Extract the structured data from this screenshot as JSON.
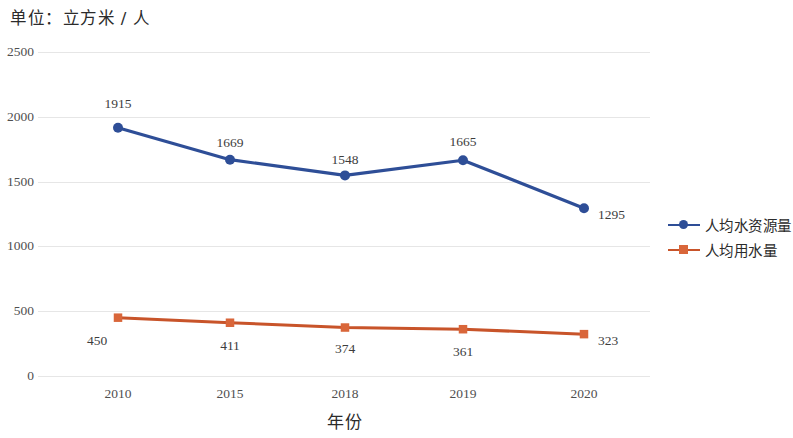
{
  "unit_title": "单位：立方米 / 人",
  "axis": {
    "x_title": "年份"
  },
  "legend": {
    "position": "right",
    "items": [
      {
        "label": "人均水资源量",
        "color": "#2E4E97",
        "marker": "circle"
      },
      {
        "label": "人均用水量",
        "color": "#C8542A",
        "marker": "square"
      }
    ]
  },
  "colors": {
    "series_blue": "#2E4E97",
    "series_orange": "#C8542A",
    "gridline": "#e6e6e6",
    "text": "#3d3d3d",
    "background": "#ffffff"
  },
  "chart_data": {
    "type": "line",
    "title": "单位：立方米 / 人",
    "xlabel": "年份",
    "ylabel": "",
    "categories": [
      "2010",
      "2015",
      "2018",
      "2019",
      "2020"
    ],
    "yticks": [
      "0",
      "500",
      "1000",
      "1500",
      "2000",
      "2500"
    ],
    "ylim": [
      0,
      2500
    ],
    "grid": true,
    "legend_position": "right",
    "series": [
      {
        "name": "人均水资源量",
        "color": "#2E4E97",
        "marker": "circle",
        "values": [
          1915,
          1669,
          1548,
          1665,
          1295
        ],
        "labels": [
          "1915",
          "1669",
          "1548",
          "1665",
          "1295"
        ]
      },
      {
        "name": "人均用水量",
        "color": "#C8542A",
        "marker": "square",
        "values": [
          450,
          411,
          374,
          361,
          323
        ],
        "labels": [
          "450",
          "411",
          "374",
          "361",
          "323"
        ]
      }
    ]
  }
}
